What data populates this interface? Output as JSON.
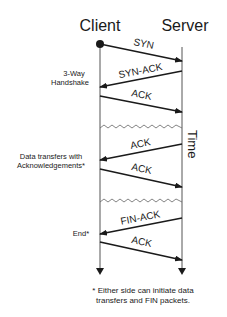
{
  "diagram": {
    "actors": {
      "client": "Client",
      "server": "Server"
    },
    "time_label": "Time",
    "messages": [
      {
        "label": "SYN",
        "direction": "client-to-server"
      },
      {
        "label": "SYN-ACK",
        "direction": "server-to-client"
      },
      {
        "label": "ACK",
        "direction": "client-to-server"
      },
      {
        "label": "ACK",
        "direction": "server-to-client"
      },
      {
        "label": "ACK",
        "direction": "client-to-server"
      },
      {
        "label": "FIN-ACK",
        "direction": "server-to-client"
      },
      {
        "label": "ACK",
        "direction": "client-to-server"
      }
    ],
    "phases": {
      "handshake_line1": "3-Way",
      "handshake_line2": "Handshake",
      "data_line1": "Data transfers with",
      "data_line2": "Acknowledgements*",
      "end": "End*"
    },
    "footnote": {
      "line1": "* Either side can initiate data",
      "line2": "transfers and FIN packets."
    },
    "colors": {
      "ink": "#1a1a1a",
      "lifeline": "#555555",
      "background": "#ffffff"
    }
  }
}
